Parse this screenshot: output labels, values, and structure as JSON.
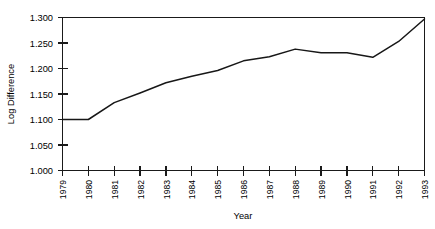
{
  "chart_data": {
    "type": "line",
    "title": "",
    "xlabel": "Year",
    "ylabel": "Log Difference",
    "grid": false,
    "legend": "none",
    "xlim": [
      1979,
      1993
    ],
    "ylim": [
      1.0,
      1.3
    ],
    "ytick_labels": [
      "1.300",
      "1.250",
      "1.200",
      "1.150",
      "1.100",
      "1.050",
      "1.000"
    ],
    "ytick_values": [
      1.3,
      1.25,
      1.2,
      1.15,
      1.1,
      1.05,
      1.0
    ],
    "xtick_labels": [
      "1979",
      "1980",
      "1981",
      "1982",
      "1983",
      "1984",
      "1985",
      "1986",
      "1987",
      "1988",
      "1989",
      "1990",
      "1991",
      "1992",
      "1993"
    ],
    "categories": [
      1979,
      1980,
      1981,
      1982,
      1983,
      1984,
      1985,
      1986,
      1987,
      1988,
      1989,
      1990,
      1991,
      1992,
      1993
    ],
    "series": [
      {
        "name": "Log Difference",
        "color": "#171717",
        "values": [
          1.1,
          1.1,
          1.133,
          1.152,
          1.172,
          1.185,
          1.196,
          1.215,
          1.223,
          1.238,
          1.231,
          1.231,
          1.222,
          1.253,
          1.297
        ]
      }
    ],
    "annotations": []
  }
}
